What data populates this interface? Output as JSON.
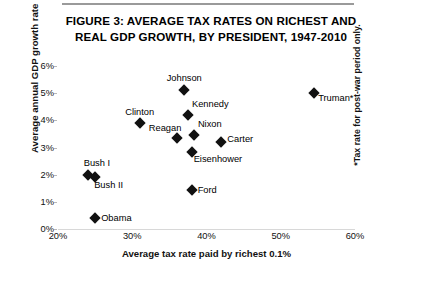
{
  "figure": {
    "title_line1": "FIGURE 3: AVERAGE TAX RATES ON RICHEST AND",
    "title_line2": "REAL GDP GROWTH, BY PRESIDENT, 1947-2010",
    "footnote": "*Tax rate for post-war period only.",
    "marker_color": "#111111",
    "rule_color": "#9a9a9a"
  },
  "chart_data": {
    "type": "scatter",
    "title": "FIGURE 3: AVERAGE TAX RATES ON RICHEST AND REAL GDP GROWTH, BY PRESIDENT, 1947-2010",
    "xlabel": "Average tax rate paid by richest 0.1%",
    "ylabel": "Average annual GDP growth rate",
    "xlim": [
      20,
      60
    ],
    "ylim": [
      0,
      6
    ],
    "xticks": [
      "20%",
      "30%",
      "40%",
      "50%",
      "60%"
    ],
    "xtick_values": [
      20,
      30,
      40,
      50,
      60
    ],
    "yticks": [
      "0%",
      "1%",
      "2%",
      "3%",
      "4%",
      "5%",
      "6%"
    ],
    "ytick_values": [
      0,
      1,
      2,
      3,
      4,
      5,
      6
    ],
    "grid": false,
    "legend": "none",
    "annotation": "*Tax rate for post-war period only.",
    "points": [
      {
        "name": "Truman*",
        "x": 54.5,
        "y": 5.0,
        "label_dx": 4,
        "label_dy": 5
      },
      {
        "name": "Johnson",
        "x": 37.0,
        "y": 5.1,
        "label_dx": 0,
        "label_dy": -12
      },
      {
        "name": "Kennedy",
        "x": 37.5,
        "y": 4.2,
        "label_dx": 4,
        "label_dy": -11
      },
      {
        "name": "Clinton",
        "x": 31.0,
        "y": 3.9,
        "label_dx": 0,
        "label_dy": -11
      },
      {
        "name": "Reagan",
        "x": 36.0,
        "y": 3.35,
        "label_dx": -28,
        "label_dy": -10
      },
      {
        "name": "Nixon",
        "x": 38.3,
        "y": 3.45,
        "label_dx": 4,
        "label_dy": -11
      },
      {
        "name": "Carter",
        "x": 42.0,
        "y": 3.2,
        "label_dx": 6,
        "label_dy": -3
      },
      {
        "name": "Eisenhower",
        "x": 38.0,
        "y": 2.85,
        "label_dx": 2,
        "label_dy": 7
      },
      {
        "name": "Bush I",
        "x": 24.0,
        "y": 2.0,
        "label_dx": -4,
        "label_dy": -12
      },
      {
        "name": "Bush II",
        "x": 25.0,
        "y": 1.9,
        "label_dx": -1,
        "label_dy": 8
      },
      {
        "name": "Ford",
        "x": 38.0,
        "y": 1.45,
        "label_dx": 6,
        "label_dy": 0
      },
      {
        "name": "Obama",
        "x": 25.0,
        "y": 0.4,
        "label_dx": 6,
        "label_dy": 0
      }
    ]
  }
}
